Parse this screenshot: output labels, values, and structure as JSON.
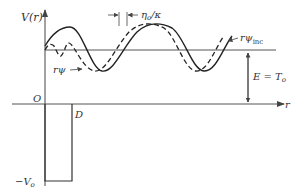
{
  "diagram": {
    "type": "potential-well-wavefunction",
    "y_axis_label": "V(r)",
    "x_axis_label": "r",
    "origin_label": "O",
    "well_edge_label": "D",
    "well_depth_label": "−V",
    "well_depth_sub": "o",
    "energy_label": "E = T",
    "energy_sub": "o",
    "shift_label": "η",
    "shift_sub": "o",
    "shift_suffix": "/κ",
    "wave_inside_label": "rψ",
    "wave_incident_label": "rψ",
    "wave_incident_sub": "inc",
    "colors": {
      "line": "#333333",
      "axis": "#555555",
      "background": "#ffffff"
    }
  }
}
